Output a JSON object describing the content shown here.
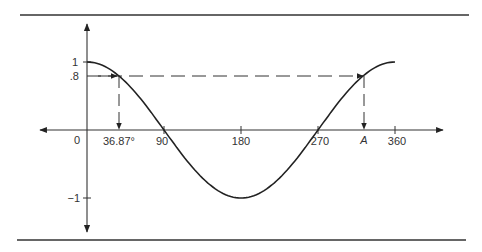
{
  "chart_data": {
    "type": "line",
    "title": "",
    "function": "cos(x)",
    "xlabel": "",
    "ylabel": "",
    "xlim": [
      0,
      360
    ],
    "ylim": [
      -1,
      1
    ],
    "x_ticks": [
      {
        "value": 0,
        "label": "0"
      },
      {
        "value": 36.87,
        "label": "36.87°"
      },
      {
        "value": 90,
        "label": "90"
      },
      {
        "value": 180,
        "label": "180"
      },
      {
        "value": 270,
        "label": "270"
      },
      {
        "value": 323.13,
        "label": "A"
      },
      {
        "value": 360,
        "label": "360"
      }
    ],
    "y_ticks": [
      {
        "value": 1,
        "label": "1"
      },
      {
        "value": 0.8,
        "label": ".8"
      },
      {
        "value": -1,
        "label": "-1"
      }
    ],
    "series": [
      {
        "name": "cos x",
        "x": [
          0,
          36.87,
          90,
          180,
          270,
          323.13,
          360
        ],
        "y": [
          1,
          0.8,
          0,
          -1,
          0,
          0.8,
          1
        ]
      }
    ],
    "annotations": [
      {
        "type": "dashed-horizontal",
        "y": 0.8,
        "from_x": 0,
        "to_x": 323.13,
        "arrows": [
          "at 36.87",
          "at A"
        ]
      },
      {
        "type": "dashed-vertical",
        "x": 36.87,
        "from_y": 0.8,
        "to_y": 0,
        "arrow": "down"
      },
      {
        "type": "dashed-vertical",
        "x": 323.13,
        "from_y": 0.8,
        "to_y": 0,
        "arrow": "down"
      }
    ],
    "grid": false,
    "legend": null
  },
  "labels": {
    "x0": "0",
    "x_angle": "36.87°",
    "x90": "90",
    "x180": "180",
    "x270": "270",
    "xA": "A",
    "x360": "360",
    "y1": "1",
    "y08": ".8",
    "yneg1": "−1"
  }
}
